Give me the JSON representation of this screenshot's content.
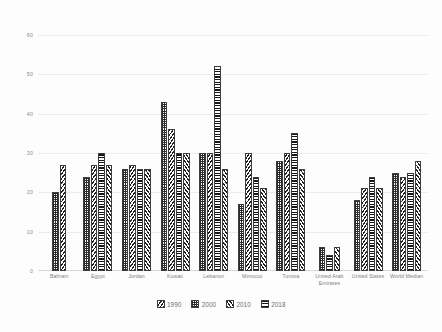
{
  "chart_data": {
    "type": "bar",
    "title": "",
    "xlabel": "",
    "ylabel": "",
    "ylim": [
      0,
      60
    ],
    "yticks": [
      0,
      10,
      20,
      30,
      40,
      50,
      60
    ],
    "grid": true,
    "legend_position": "bottom",
    "categories": [
      "Bahrain",
      "Egypt",
      "Jordan",
      "Kuwait",
      "Lebanon",
      "Morocco",
      "Tunisia",
      "United Arab Emirates",
      "United States",
      "World Median"
    ],
    "series": [
      {
        "name": "1990",
        "pattern": "diagonal-back-hatch",
        "values": [
          27,
          27,
          27,
          36,
          30,
          30,
          30,
          null,
          21,
          24
        ]
      },
      {
        "name": "2000",
        "pattern": "cross-dot-hatch",
        "values": [
          20,
          24,
          26,
          43,
          30,
          17,
          28,
          6,
          18,
          25
        ]
      },
      {
        "name": "2010",
        "pattern": "diagonal-forward-hatch",
        "values": [
          null,
          27,
          26,
          30,
          26,
          21,
          26,
          6,
          21,
          28
        ]
      },
      {
        "name": "2018",
        "pattern": "horizontal-line-hatch",
        "values": [
          null,
          30,
          26,
          30,
          52,
          24,
          35,
          4,
          24,
          25
        ]
      }
    ]
  },
  "legend": {
    "items": [
      {
        "label": "1990",
        "pattern": "p-1990"
      },
      {
        "label": "2000",
        "pattern": "p-2000"
      },
      {
        "label": "2010",
        "pattern": "p-2010"
      },
      {
        "label": "2018",
        "pattern": "p-2018"
      }
    ]
  },
  "colors": {
    "background": "#fdfdfd",
    "gridline": "#eceaea",
    "axis": "#d9d7d7",
    "tick_text": "#8a8a8a",
    "label_text": "#7f7f7f",
    "bar_ink": "#1f1f1f"
  }
}
